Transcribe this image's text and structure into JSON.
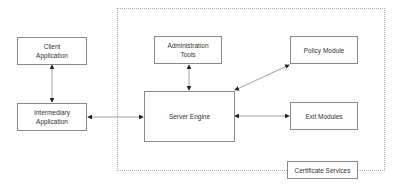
{
  "diagram": {
    "boundary_label": "Certificate Services",
    "nodes": {
      "client": "Client\nApplication",
      "intermediary": "Intermediary\nApplication",
      "admin": "Administration\nTools",
      "server": "Server Engine",
      "policy": "Policy Module",
      "exit": "Exit Modules"
    },
    "edges": [
      {
        "from": "client",
        "to": "intermediary",
        "direction": "both"
      },
      {
        "from": "intermediary",
        "to": "server",
        "direction": "both"
      },
      {
        "from": "admin",
        "to": "server",
        "direction": "both"
      },
      {
        "from": "server",
        "to": "policy",
        "direction": "both"
      },
      {
        "from": "server",
        "to": "exit",
        "direction": "both"
      }
    ],
    "colors": {
      "stroke": "#8a8a8a",
      "arrow": "#222222",
      "boundary": "#b0b0b0",
      "text": "#333333"
    }
  }
}
